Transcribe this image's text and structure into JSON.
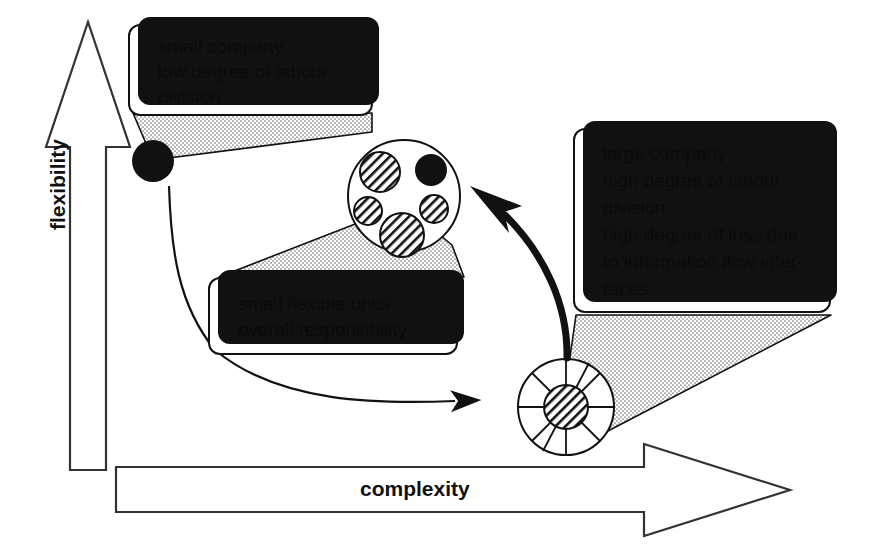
{
  "diagram": {
    "axes": {
      "y_label": "flexibility",
      "x_label": "complexity"
    },
    "colors": {
      "ink": "#111111",
      "paper": "#ffffff",
      "shadow": "#111111",
      "stipple": "#8a8a8a"
    },
    "callouts": [
      {
        "id": "small-company",
        "bullets": [
          {
            "text": "small company",
            "continuation": null
          },
          {
            "text": "low degree of labour",
            "continuation": "division"
          }
        ]
      },
      {
        "id": "small-flexible-units",
        "bullets": [
          {
            "text": "small flexible units",
            "continuation": null
          },
          {
            "text": "overall responsibility",
            "continuation": null
          }
        ]
      },
      {
        "id": "large-company",
        "bullets": [
          {
            "text": "large company",
            "continuation": null
          },
          {
            "text": "high degree of labour",
            "continuation": "division"
          },
          {
            "text": "high degree of loss due",
            "continuation": "to information flow inter-|faces"
          }
        ]
      }
    ],
    "nodes": [
      {
        "id": "single-solid-node",
        "kind": "solid-circle"
      },
      {
        "id": "clustered-units-node",
        "kind": "circle-with-hatched-subunits"
      },
      {
        "id": "segmented-wheel-node",
        "kind": "segmented-wheel-with-hatched-hub"
      }
    ],
    "arrows": [
      {
        "id": "thin-arrow-to-wheel",
        "style": "thin-curved",
        "direction": "right"
      },
      {
        "id": "thick-arrow-to-cluster",
        "style": "thick-curved",
        "direction": "up-left"
      }
    ]
  }
}
